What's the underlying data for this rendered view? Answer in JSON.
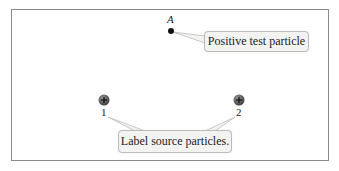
{
  "diagram": {
    "test_point": {
      "label": "A",
      "kind": "point",
      "color": "#111111"
    },
    "source_particles": [
      {
        "label": "1",
        "sign": "+",
        "color": "#5a5a5a"
      },
      {
        "label": "2",
        "sign": "+",
        "color": "#5a5a5a"
      }
    ],
    "callouts": {
      "test_particle": "Positive test particle",
      "source_particles": "Label source particles."
    },
    "colors": {
      "frame": "#8a8a8a",
      "callout_fill": "#f3f4f2",
      "callout_border": "#b9bcb8"
    }
  }
}
